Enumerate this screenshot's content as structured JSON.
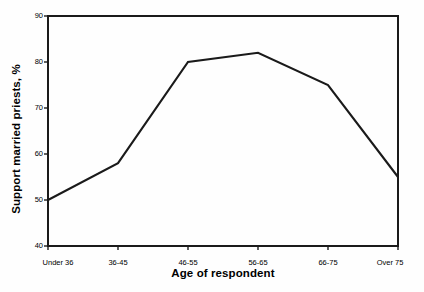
{
  "chart_data": {
    "type": "line",
    "title": "",
    "xlabel": "Age of respondent",
    "ylabel": "Support married priests, %",
    "categories": [
      "Under 36",
      "36-45",
      "46-55",
      "56-65",
      "66-75",
      "Over 75"
    ],
    "values": [
      50,
      58,
      80,
      82,
      75,
      55
    ],
    "series": [
      {
        "name": "Support married priests",
        "values": [
          50,
          58,
          80,
          82,
          75,
          55
        ]
      }
    ],
    "ylim": [
      40,
      90
    ],
    "yticks": [
      40,
      50,
      60,
      70,
      80,
      90
    ],
    "ytick_labels": [
      "40",
      "50",
      "60",
      "70",
      "80",
      "90"
    ],
    "grid": false,
    "legend": "none",
    "line_color": "#1a1a1a",
    "axis_color": "#1a1a1a",
    "background_color": "#ffffff"
  },
  "axes": {
    "y_title": "Support married priests, %",
    "x_title": "Age of respondent",
    "y_ticks": [
      {
        "value": 90,
        "label": "90"
      },
      {
        "value": 80,
        "label": "80"
      },
      {
        "value": 70,
        "label": "70"
      },
      {
        "value": 60,
        "label": "60"
      },
      {
        "value": 50,
        "label": "50"
      },
      {
        "value": 40,
        "label": "40"
      }
    ],
    "x_ticks": [
      {
        "index": 0,
        "label": "Under 36"
      },
      {
        "index": 1,
        "label": "36-45"
      },
      {
        "index": 2,
        "label": "46-55"
      },
      {
        "index": 3,
        "label": "56-65"
      },
      {
        "index": 4,
        "label": "66-75"
      },
      {
        "index": 5,
        "label": "Over 75"
      }
    ]
  }
}
